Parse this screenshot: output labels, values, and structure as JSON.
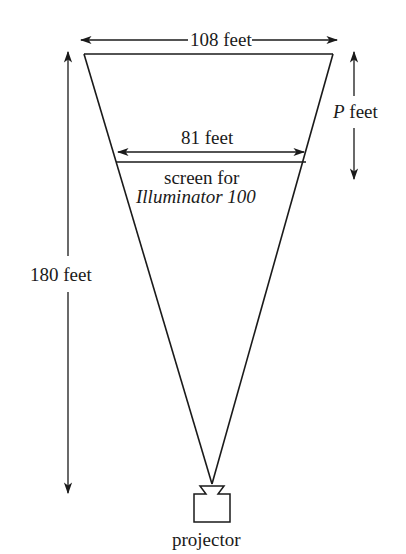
{
  "diagram": {
    "labels": {
      "top_width": "108 feet",
      "screen_width": "81 feet",
      "screen_caption_line1": "screen for",
      "screen_caption_line2": "Illuminator 100",
      "height": "180 feet",
      "p_var": "P",
      "p_unit": "feet",
      "projector": "projector"
    },
    "colors": {
      "line": "#1a1a1a",
      "background": "#ffffff"
    }
  }
}
